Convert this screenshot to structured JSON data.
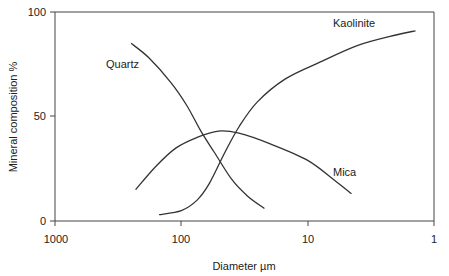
{
  "chart_data": {
    "type": "line",
    "title": "",
    "xlabel": "Diameter µm",
    "ylabel": "Mineral composition %",
    "xscale": "log",
    "xlim": [
      1000,
      1
    ],
    "ylim": [
      0,
      100
    ],
    "x_ticks": [
      "1000",
      "100",
      "10",
      "1"
    ],
    "y_ticks": [
      "0",
      "50",
      "100"
    ],
    "grid": false,
    "legend": "inline labels",
    "series": [
      {
        "name": "Quartz",
        "points": [
          [
            250,
            85
          ],
          [
            180,
            78
          ],
          [
            120,
            66
          ],
          [
            90,
            55
          ],
          [
            70,
            43
          ],
          [
            55,
            33
          ],
          [
            40,
            20
          ],
          [
            30,
            12
          ],
          [
            22,
            6
          ]
        ]
      },
      {
        "name": "Mica",
        "points": [
          [
            230,
            15
          ],
          [
            160,
            26
          ],
          [
            110,
            35
          ],
          [
            75,
            40
          ],
          [
            51,
            43
          ],
          [
            35,
            42
          ],
          [
            20,
            37
          ],
          [
            10,
            29
          ],
          [
            6,
            19
          ],
          [
            4.5,
            13
          ]
        ]
      },
      {
        "name": "Kaolinite",
        "points": [
          [
            150,
            3
          ],
          [
            100,
            5
          ],
          [
            75,
            10
          ],
          [
            60,
            18
          ],
          [
            45,
            33
          ],
          [
            35,
            45
          ],
          [
            25,
            57
          ],
          [
            15,
            68
          ],
          [
            8,
            76
          ],
          [
            4,
            84
          ],
          [
            2,
            89
          ],
          [
            1.4,
            91
          ]
        ]
      }
    ],
    "annotations": [
      {
        "text": "Quartz",
        "near": "Quartz"
      },
      {
        "text": "Mica",
        "near": "Mica"
      },
      {
        "text": "Kaolinite",
        "near": "Kaolinite"
      }
    ]
  },
  "labels": {
    "xlabel": "Diameter µm",
    "ylabel": "Mineral composition %",
    "x_ticks": [
      "1000",
      "100",
      "10",
      "1"
    ],
    "y_ticks": [
      "0",
      "50",
      "100"
    ],
    "series": [
      "Quartz",
      "Mica",
      "Kaolinite"
    ]
  }
}
